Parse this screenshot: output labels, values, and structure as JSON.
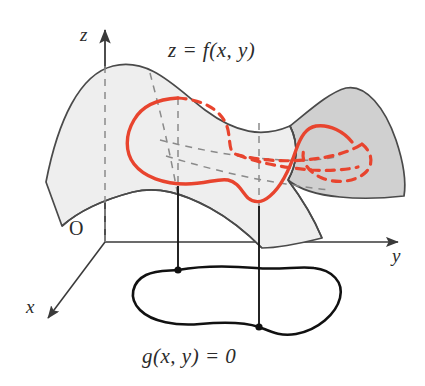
{
  "figure": {
    "type": "3d-math-diagram",
    "background_color": "#ffffff"
  },
  "labels": {
    "surface_equation": "z = f(x, y)",
    "constraint_equation": "g(x, y) = 0",
    "axis_z": "z",
    "axis_y": "y",
    "axis_x": "x",
    "origin": "O"
  },
  "colors": {
    "ink": "#2b2b2b",
    "outline": "#4a4a4a",
    "surface_front_fill": "#eeeeee",
    "surface_back_fill": "#d0d0d0",
    "hidden_line": "#8a8a8a",
    "constraint_curve": "#111111",
    "trace_curve": "#e8442e",
    "axis": "#3a3a3a"
  },
  "elements": {
    "axes": [
      {
        "name": "z-axis",
        "direction": "up",
        "arrow": true
      },
      {
        "name": "y-axis",
        "direction": "right",
        "arrow": true
      },
      {
        "name": "x-axis",
        "direction": "down-left",
        "arrow": true
      }
    ],
    "surface": {
      "name": "surface-z-equals-f",
      "shading": "two-tone gray saddle sheet",
      "front_fill": "#eeeeee",
      "back_fill": "#d0d0d0"
    },
    "trace_curve": {
      "name": "red-trace-on-surface",
      "color": "#e8442e",
      "style": "solid front arc with dashed hidden back arc",
      "closed": true
    },
    "constraint_curve": {
      "name": "closed-blob-curve",
      "color": "#111111",
      "closed": true,
      "marked_points": 2
    },
    "projection_lines": [
      {
        "name": "projection-line-left",
        "from_surface_y": 196,
        "to_plane_y": 268,
        "x": 178
      },
      {
        "name": "projection-line-right",
        "from_surface_y": 212,
        "to_plane_y": 325,
        "x": 259
      }
    ]
  }
}
